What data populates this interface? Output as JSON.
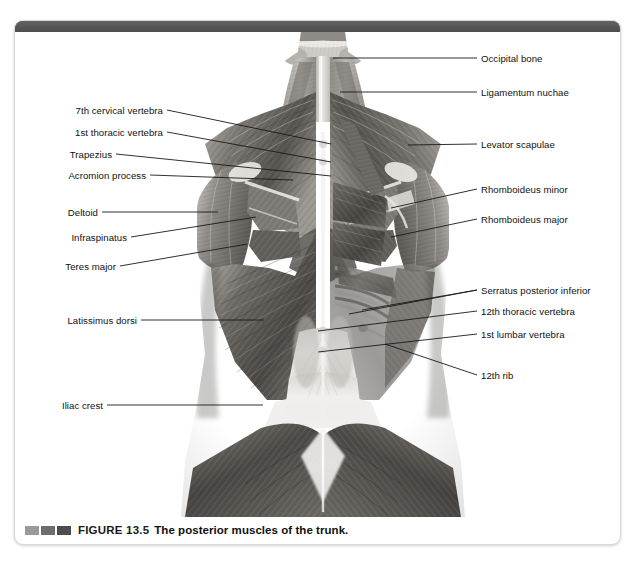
{
  "figure": {
    "number_label": "FIGURE 13.5",
    "title": "The posterior muscles of the trunk.",
    "caption_marks": [
      "#9a9a9a",
      "#6e6e6e",
      "#4c4c4c"
    ],
    "accent_bar_color": "#565656"
  },
  "illustration": {
    "alt_name": "posterior-trunk-muscles-illustration",
    "palette": {
      "skin_light": "#e9e7e5",
      "muscle_light": "#c9c6c2",
      "muscle_mid": "#8f8c88",
      "muscle_dark": "#5a5754",
      "muscle_deep": "#3c3a38",
      "tendon": "#f2f0ee",
      "background": "#ffffff"
    }
  },
  "labels_left": [
    {
      "text": "7th cervical vertebra",
      "text_x": 148,
      "text_y": 78,
      "lx1": 152,
      "ly1": 78,
      "lx2": 316,
      "ly2": 112
    },
    {
      "text": "1st thoracic vertebra",
      "text_x": 148,
      "text_y": 100,
      "lx1": 152,
      "ly1": 100,
      "lx2": 316,
      "ly2": 130
    },
    {
      "text": "Trapezius",
      "text_x": 97,
      "text_y": 122,
      "lx1": 101,
      "ly1": 122,
      "lx2": 316,
      "ly2": 144
    },
    {
      "text": "Acromion process",
      "text_x": 131,
      "text_y": 143,
      "lx1": 135,
      "ly1": 143,
      "lx2": 278,
      "ly2": 148
    },
    {
      "text": "Deltoid",
      "text_x": 83,
      "text_y": 180,
      "lx1": 87,
      "ly1": 180,
      "lx2": 203,
      "ly2": 180
    },
    {
      "text": "Infraspinatus",
      "text_x": 112,
      "text_y": 205,
      "lx1": 116,
      "ly1": 205,
      "lx2": 241,
      "ly2": 185
    },
    {
      "text": "Teres major",
      "text_x": 101,
      "text_y": 234,
      "lx1": 105,
      "ly1": 234,
      "lx2": 232,
      "ly2": 212
    },
    {
      "text": "Latissimus dorsi",
      "text_x": 122,
      "text_y": 288,
      "lx1": 126,
      "ly1": 288,
      "lx2": 249,
      "ly2": 288
    },
    {
      "text": "Iliac crest",
      "text_x": 88,
      "text_y": 373,
      "lx1": 92,
      "ly1": 373,
      "lx2": 248,
      "ly2": 373
    }
  ],
  "labels_right": [
    {
      "text": "Occipital bone",
      "text_x": 466,
      "text_y": 26,
      "lx1": 462,
      "ly1": 26,
      "lx2": 318,
      "ly2": 26
    },
    {
      "text": "Ligamentum nuchae",
      "text_x": 466,
      "text_y": 60,
      "lx1": 462,
      "ly1": 60,
      "lx2": 325,
      "ly2": 60
    },
    {
      "text": "Levator scapulae",
      "text_x": 466,
      "text_y": 112,
      "lx1": 462,
      "ly1": 112,
      "lx2": 393,
      "ly2": 113
    },
    {
      "text": "Rhomboideus minor",
      "text_x": 466,
      "text_y": 157,
      "lx1": 462,
      "ly1": 157,
      "lx2": 376,
      "ly2": 176
    },
    {
      "text": "Rhomboideus major",
      "text_x": 466,
      "text_y": 187,
      "lx1": 462,
      "ly1": 187,
      "lx2": 376,
      "ly2": 205
    },
    {
      "text": "Serratus posterior inferior",
      "text_x": 466,
      "text_y": 258,
      "lx1": 462,
      "ly1": 258,
      "lx2": 347,
      "ly2": 278
    },
    {
      "text": "Serratus posterior inferior",
      "text_x": -999,
      "text_y": -999,
      "lx1": 462,
      "ly1": 258,
      "lx2": 334,
      "ly2": 282
    },
    {
      "text": "12th thoracic vertebra",
      "text_x": 466,
      "text_y": 279,
      "lx1": 462,
      "ly1": 279,
      "lx2": 303,
      "ly2": 299
    },
    {
      "text": "1st lumbar vertebra",
      "text_x": 466,
      "text_y": 302,
      "lx1": 462,
      "ly1": 302,
      "lx2": 303,
      "ly2": 320
    },
    {
      "text": "12th rib",
      "text_x": 466,
      "text_y": 343,
      "lx1": 462,
      "ly1": 343,
      "lx2": 370,
      "ly2": 312
    }
  ]
}
